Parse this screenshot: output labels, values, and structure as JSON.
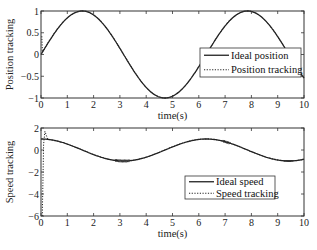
{
  "chart_data": [
    {
      "type": "line",
      "title": "",
      "xlabel": "time(s)",
      "ylabel": "Position tracking",
      "xlim": [
        0,
        10
      ],
      "ylim": [
        -1,
        1
      ],
      "xticks": [
        0,
        1,
        2,
        3,
        4,
        5,
        6,
        7,
        8,
        9,
        10
      ],
      "yticks": [
        1,
        0.5,
        0,
        -0.5,
        -1
      ],
      "ytick_labels": [
        "1",
        "0.5",
        "0",
        "-0.5",
        "-1"
      ],
      "grid": false,
      "legend_position": "right-center",
      "series": [
        {
          "name": "Ideal position",
          "style": "solid",
          "function": "sin(t)",
          "x": [
            0,
            0.5,
            1,
            1.5,
            2,
            2.5,
            3,
            3.5,
            4,
            4.5,
            5,
            5.5,
            6,
            6.5,
            7,
            7.5,
            8,
            8.5,
            9,
            9.5,
            10
          ],
          "values": [
            0,
            0.48,
            0.84,
            1.0,
            0.91,
            0.6,
            0.14,
            -0.35,
            -0.76,
            -0.98,
            -0.96,
            -0.71,
            -0.28,
            0.22,
            0.66,
            0.94,
            0.99,
            0.8,
            0.41,
            -0.08,
            -0.54
          ]
        },
        {
          "name": "Position tracking",
          "style": "dotted",
          "note": "starts near 0.4 at t=0, converges to ideal quickly",
          "x": [
            0,
            0.05,
            0.1,
            0.5,
            1,
            1.5,
            2,
            2.5,
            3,
            3.5,
            4,
            4.5,
            5,
            5.5,
            6,
            6.5,
            7,
            7.5,
            8,
            8.5,
            9,
            9.5,
            10
          ],
          "values": [
            0.4,
            0.1,
            0.1,
            0.48,
            0.84,
            1.0,
            0.91,
            0.6,
            0.14,
            -0.35,
            -0.76,
            -0.98,
            -0.96,
            -0.71,
            -0.28,
            0.22,
            0.66,
            0.94,
            0.99,
            0.8,
            0.41,
            -0.08,
            -0.54
          ]
        }
      ]
    },
    {
      "type": "line",
      "title": "",
      "xlabel": "time(s)",
      "ylabel": "Speed tracking",
      "xlim": [
        0,
        10
      ],
      "ylim": [
        -6,
        2
      ],
      "xticks": [
        0,
        1,
        2,
        3,
        4,
        5,
        6,
        7,
        8,
        9,
        10
      ],
      "yticks": [
        2,
        0,
        -2,
        -4,
        -6
      ],
      "ytick_labels": [
        "2",
        "0",
        "-2",
        "-4",
        "-6"
      ],
      "grid": false,
      "legend_position": "lower-right",
      "series": [
        {
          "name": "Ideal speed",
          "style": "solid",
          "function": "cos(t)",
          "x": [
            0,
            0.5,
            1,
            1.5,
            2,
            2.5,
            3,
            3.5,
            4,
            4.5,
            5,
            5.5,
            6,
            6.5,
            7,
            7.5,
            8,
            8.5,
            9,
            9.5,
            10
          ],
          "values": [
            1,
            0.88,
            0.54,
            0.07,
            -0.42,
            -0.8,
            -0.99,
            -0.94,
            -0.65,
            -0.21,
            0.28,
            0.71,
            0.96,
            0.98,
            0.75,
            0.35,
            -0.15,
            -0.6,
            -0.91,
            -1.0,
            -0.84
          ]
        },
        {
          "name": "Speed tracking",
          "style": "dotted",
          "note": "starts at -6 at t=0, overshoots to ~1.7 at t~0.15, then tracks ideal with small chattering",
          "x": [
            0,
            0.1,
            0.15,
            0.3,
            0.5,
            1,
            1.5,
            2,
            2.5,
            3,
            3.5,
            4,
            4.5,
            5,
            5.5,
            6,
            6.5,
            7,
            7.5,
            8,
            8.5,
            9,
            9.5,
            10
          ],
          "values": [
            -6,
            1.0,
            1.7,
            0.95,
            0.88,
            0.54,
            0.07,
            -0.42,
            -0.8,
            -0.99,
            -0.94,
            -0.65,
            -0.21,
            0.28,
            0.71,
            0.96,
            0.98,
            0.75,
            0.35,
            -0.15,
            -0.6,
            -0.91,
            -1.0,
            -0.84
          ]
        }
      ]
    }
  ],
  "plots": {
    "top": {
      "ylabel": "Position tracking",
      "xlabel": "time(s)",
      "legend": [
        "Ideal position",
        "Position tracking"
      ]
    },
    "bottom": {
      "ylabel": "Speed tracking",
      "xlabel": "time(s)",
      "legend": [
        "Ideal speed",
        "Speed tracking"
      ]
    }
  }
}
